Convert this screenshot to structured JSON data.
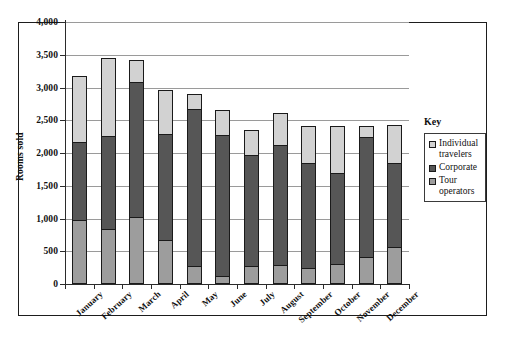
{
  "chart_data": {
    "type": "bar",
    "stacked": true,
    "title": "",
    "xlabel": "",
    "ylabel": "Rooms sold",
    "ylim": [
      0,
      4000
    ],
    "ytick_values": [
      0,
      500,
      1000,
      1500,
      2000,
      2500,
      3000,
      3500,
      4000
    ],
    "ytick_labels": [
      "0",
      "500",
      "1,000",
      "1,500",
      "2,000",
      "2,500",
      "3,000",
      "3,500",
      "4,000"
    ],
    "grid": true,
    "legend_position": "right",
    "legend_title": "Key",
    "categories": [
      "January",
      "February",
      "March",
      "April",
      "May",
      "June",
      "July",
      "August",
      "September",
      "October",
      "November",
      "December"
    ],
    "series": [
      {
        "name": "Tour operators",
        "color": "#9d9d9d",
        "values": [
          975,
          835,
          1030,
          670,
          270,
          130,
          275,
          295,
          250,
          310,
          415,
          570
        ]
      },
      {
        "name": "Corporate",
        "color": "#565656",
        "values": [
          1190,
          1430,
          2050,
          1620,
          2395,
          2150,
          1700,
          1830,
          1590,
          1385,
          1830,
          1275
        ]
      },
      {
        "name": "Individual travelers",
        "color": "#d2d2d2",
        "values": [
          1010,
          1185,
          345,
          665,
          240,
          375,
          370,
          490,
          575,
          720,
          175,
          580
        ]
      }
    ],
    "cumulative_tops": {
      "tour_operators": [
        975,
        835,
        1030,
        670,
        270,
        130,
        275,
        295,
        250,
        310,
        415,
        570
      ],
      "plus_corporate": [
        2165,
        2265,
        3080,
        2290,
        2665,
        2280,
        1975,
        2125,
        1840,
        1695,
        2245,
        1845
      ],
      "totals": [
        3175,
        3450,
        3425,
        2955,
        2905,
        2655,
        2345,
        2615,
        2415,
        2415,
        2420,
        2425
      ]
    }
  },
  "legend": {
    "title": "Key",
    "entries": [
      {
        "label": "Individual travelers",
        "swatch_class": "sw-individual"
      },
      {
        "label": "Corporate",
        "swatch_class": "sw-corporate"
      },
      {
        "label": "Tour operators",
        "swatch_class": "sw-tour"
      }
    ]
  },
  "axes": {
    "y_axis_title": "Rooms sold"
  },
  "colors": {
    "individual_travelers": "#d2d2d2",
    "corporate": "#565656",
    "tour_operators": "#9d9d9d",
    "gridline": "#9a9a9a",
    "axis": "#2b2b2b",
    "frame": "#1d1d1d"
  }
}
